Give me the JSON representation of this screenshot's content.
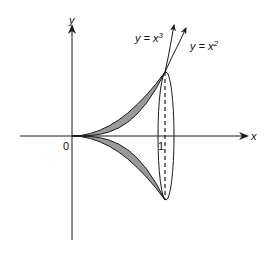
{
  "figure": {
    "axes": {
      "x_label": "x",
      "y_label": "y",
      "origin_label": "0",
      "tick_label_x": "1"
    },
    "curves": [
      {
        "name": "cubic",
        "label_prefix": "y = x",
        "label_exp": "3"
      },
      {
        "name": "quadratic",
        "label_prefix": "y = x",
        "label_exp": "2"
      }
    ],
    "colors": {
      "shading": "#9a9a9a",
      "stroke": "#1a1a1a",
      "background": "#ffffff"
    }
  }
}
